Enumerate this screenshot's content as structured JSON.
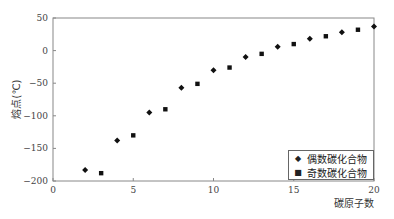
{
  "chart_data": {
    "type": "scatter",
    "title": "",
    "xlabel": "碳原子数",
    "ylabel": "熔点(℃)",
    "xlim": [
      0,
      20
    ],
    "ylim": [
      -200,
      50
    ],
    "x_ticks": [
      0,
      5,
      10,
      15,
      20
    ],
    "y_ticks": [
      50,
      0,
      -50,
      -100,
      -150,
      -200
    ],
    "grid": false,
    "legend_position": "lower right",
    "series": [
      {
        "name": "偶数碳化合物",
        "marker": "diamond",
        "x": [
          2,
          4,
          6,
          8,
          10,
          12,
          14,
          16,
          18,
          20
        ],
        "y": [
          -183,
          -138,
          -95,
          -57,
          -30,
          -10,
          6,
          18,
          28,
          37
        ]
      },
      {
        "name": "奇数碳化合物",
        "marker": "square",
        "x": [
          3,
          5,
          7,
          9,
          11,
          13,
          15,
          17,
          19
        ],
        "y": [
          -188,
          -130,
          -90,
          -51,
          -26,
          -5,
          10,
          22,
          32
        ]
      }
    ]
  },
  "legend": {
    "items": [
      {
        "label": "偶数碳化合物",
        "marker": "◆"
      },
      {
        "label": "奇数碳化合物",
        "marker": "■"
      }
    ]
  }
}
